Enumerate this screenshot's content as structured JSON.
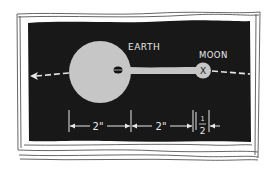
{
  "diagram": {
    "type": "hand-drawn illustration",
    "colors": {
      "background": "#ffffff",
      "panel": "#1a1a1a",
      "body_fill": "#c4c4c4",
      "line": "#e6e6e6",
      "frame_stroke": "#444444"
    },
    "earth": {
      "label": "EARTH"
    },
    "moon": {
      "label": "MOON",
      "marker": "X"
    },
    "orbit": {
      "direction": "left",
      "style": "dashed"
    },
    "dimensions": [
      {
        "label": "2\"",
        "from": "left edge of earth",
        "to": "center of earth"
      },
      {
        "label": "2\"",
        "from": "center of earth",
        "to": "moon"
      },
      {
        "label_top": "1",
        "label_bottom": "2",
        "meaning": "1/2",
        "span": "moon"
      }
    ]
  }
}
